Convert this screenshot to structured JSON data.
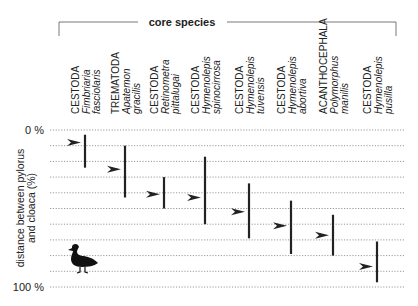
{
  "chart_data": {
    "type": "range",
    "title": "",
    "group_label": "core species",
    "ylabel": "distance between pylorus and cloaca (%)",
    "ylim": [
      0,
      100
    ],
    "ytick_labels": [
      "0 %",
      "100 %"
    ],
    "grid": "dotted horizontal every 10%",
    "categories": [
      {
        "phylum": "CESTODA",
        "genus": "Fimbriaria",
        "species": "fasciolaris",
        "min": 3,
        "max": 24,
        "mode": 8
      },
      {
        "phylum": "TREMATODA",
        "genus": "Apatemon",
        "species": "gracilis",
        "min": 10,
        "max": 43,
        "mode": 25
      },
      {
        "phylum": "CESTODA",
        "genus": "Retinometra",
        "species": "pittalugai",
        "min": 30,
        "max": 50,
        "mode": 41
      },
      {
        "phylum": "CESTODA",
        "genus": "Hymenolepis",
        "species": "spinocirrosa",
        "min": 17,
        "max": 60,
        "mode": 43
      },
      {
        "phylum": "CESTODA",
        "genus": "Hymenolepis",
        "species": "tuvensis",
        "min": 34,
        "max": 69,
        "mode": 52
      },
      {
        "phylum": "CESTODA",
        "genus": "Hymenolepis",
        "species": "abortiva",
        "min": 45,
        "max": 79,
        "mode": 61
      },
      {
        "phylum": "ACANTHOCEPHALA",
        "genus": "Polymorphus",
        "species": "manilis",
        "min": 54,
        "max": 80,
        "mode": 67
      },
      {
        "phylum": "CESTODA",
        "genus": "Hymenolepis",
        "species": "pusilla",
        "min": 71,
        "max": 97,
        "mode": 87
      }
    ],
    "icons": [
      "duck-silhouette-icon",
      "arrowhead-marker-icon"
    ]
  },
  "colors": {
    "bar": "#222222",
    "grid": "#9a9a9a",
    "text": "#222222"
  }
}
